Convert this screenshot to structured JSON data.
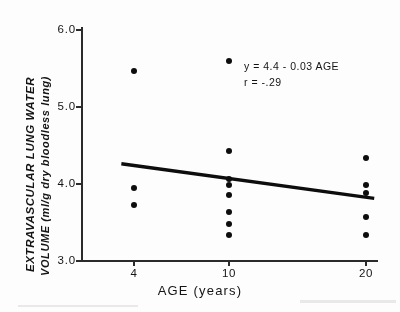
{
  "figure": {
    "title": "",
    "annotation_equation": "y = 4.4 - 0.03 AGE",
    "annotation_correlation": "r = -.29"
  },
  "chart_data": {
    "type": "scatter",
    "title": "",
    "xlabel": "AGE  (years)",
    "ylabel_line1": "EXTRAVASCULAR  LUNG  WATER",
    "ylabel_line2": "VOLUME  (ml/g  dry  bloodless  lung)",
    "xtick_labels": [
      "4",
      "10",
      "20"
    ],
    "xtick_values": [
      4,
      10,
      20
    ],
    "ytick_labels": [
      "3.0",
      "4.0",
      "5.0",
      "6.0"
    ],
    "ytick_values": [
      3.0,
      4.0,
      5.0,
      6.0
    ],
    "ylim": [
      3.0,
      6.0
    ],
    "grid": false,
    "legend": "none",
    "series": [
      {
        "name": "Extravascular lung water volume",
        "marker": "filled-circle",
        "color": "#0d0d0d",
        "points": [
          {
            "x": 4,
            "y": 5.45
          },
          {
            "x": 4,
            "y": 3.93
          },
          {
            "x": 4,
            "y": 3.71
          },
          {
            "x": 10,
            "y": 5.58
          },
          {
            "x": 10,
            "y": 4.42
          },
          {
            "x": 10,
            "y": 4.05
          },
          {
            "x": 10,
            "y": 3.98
          },
          {
            "x": 10,
            "y": 3.85
          },
          {
            "x": 10,
            "y": 3.62
          },
          {
            "x": 10,
            "y": 3.47
          },
          {
            "x": 10,
            "y": 3.33
          },
          {
            "x": 20,
            "y": 4.32
          },
          {
            "x": 20,
            "y": 3.97
          },
          {
            "x": 20,
            "y": 3.87
          },
          {
            "x": 20,
            "y": 3.56
          },
          {
            "x": 20,
            "y": 3.33
          }
        ]
      }
    ],
    "fit_line": {
      "name": "regression line",
      "equation": "y = 4.4 - 0.03 AGE",
      "correlation": "r = -.29",
      "intercept": 4.4,
      "slope": -0.03,
      "color": "#0d0d0d",
      "x_start": 3.2,
      "y_start": 4.25,
      "x_end": 20.6,
      "y_end": 3.8
    }
  }
}
